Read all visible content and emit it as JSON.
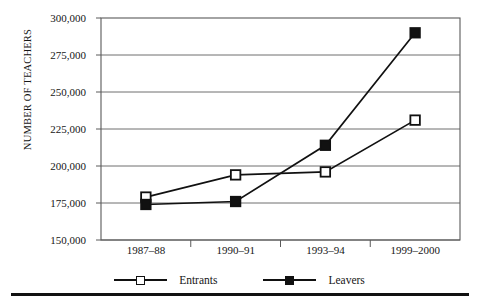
{
  "chart_data": {
    "type": "line",
    "title": "",
    "subtitle": "",
    "xlabel": "",
    "ylabel": "NUMBER OF TEACHERS",
    "categories": [
      "1987–88",
      "1990–91",
      "1993–94",
      "1999–2000"
    ],
    "series": [
      {
        "name": "Entrants",
        "marker": "open-square",
        "color": "#111111",
        "values": [
          179000,
          194000,
          196000,
          231000
        ]
      },
      {
        "name": "Leavers",
        "marker": "filled-square",
        "color": "#111111",
        "values": [
          174000,
          176000,
          214000,
          290000
        ]
      }
    ],
    "ylim": [
      150000,
      300000
    ],
    "ytick_values": [
      300000,
      275000,
      250000,
      225000,
      200000,
      175000,
      150000
    ],
    "ytick_labels": [
      "300,000",
      "275,000",
      "250,000",
      "225,000",
      "200,000",
      "175,000",
      "150,000"
    ],
    "grid": true,
    "grid_axis": "y",
    "legend_position": "bottom"
  },
  "legend": {
    "entrants_label": "Entrants",
    "leavers_label": "Leavers"
  }
}
